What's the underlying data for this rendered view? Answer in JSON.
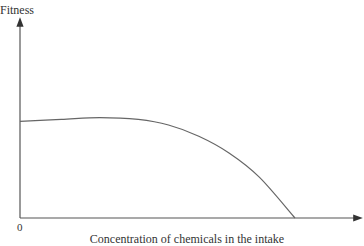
{
  "chart_data": {
    "type": "line",
    "title": "",
    "xlabel": "Concentration of chemicals in the intake",
    "ylabel": "Fitness",
    "origin_label": "0",
    "grid": false,
    "legend": null,
    "series": [
      {
        "name": "Fitness",
        "x": [
          0,
          0.15,
          0.29,
          0.43,
          0.54,
          0.65,
          0.76,
          0.87,
          1.0
        ],
        "y": [
          0.52,
          0.53,
          0.54,
          0.53,
          0.5,
          0.44,
          0.35,
          0.22,
          0.0
        ]
      }
    ]
  },
  "labels": {
    "ylabel": "Fitness",
    "xlabel": "Concentration of chemicals in the intake",
    "origin": "0"
  },
  "style": {
    "axis_color": "#555555",
    "curve_color": "#666666"
  }
}
